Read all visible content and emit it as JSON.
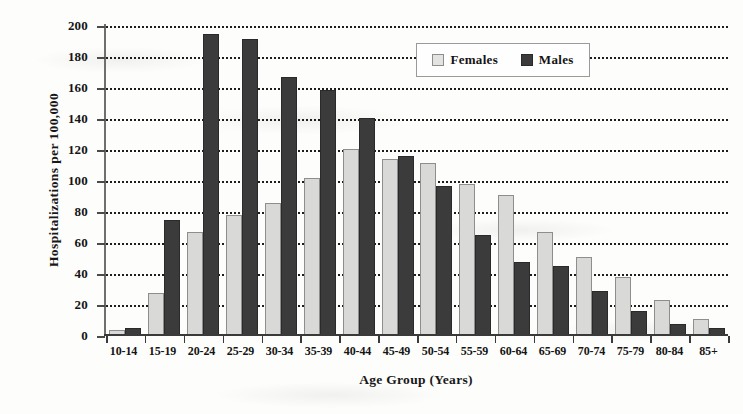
{
  "chart_data": {
    "type": "bar",
    "title": "",
    "xlabel": "Age Group (Years)",
    "ylabel": "Hospitalizations per 100,000",
    "ylim": [
      0,
      200
    ],
    "ytick_step": 20,
    "yticks": [
      "0",
      "20",
      "40",
      "60",
      "80",
      "100",
      "120",
      "140",
      "160",
      "180",
      "200"
    ],
    "grid": "horizontal-dotted",
    "legend_position": "top-center-right",
    "categories": [
      "10-14",
      "15-19",
      "20-24",
      "25-29",
      "30-34",
      "35-39",
      "40-44",
      "45-49",
      "50-54",
      "55-59",
      "60-64",
      "65-69",
      "70-74",
      "75-79",
      "80-84",
      "85+"
    ],
    "series": [
      {
        "name": "Females",
        "color": "#d9d9d7",
        "values": [
          2,
          26,
          65,
          76,
          84,
          100,
          119,
          112,
          110,
          96,
          89,
          65,
          49,
          36,
          21,
          9
        ]
      },
      {
        "name": "Males",
        "color": "#3b3b3b",
        "values": [
          3,
          73,
          193,
          190,
          165,
          157,
          139,
          114,
          95,
          63,
          46,
          43,
          27,
          14,
          6,
          3
        ]
      }
    ]
  },
  "legend": {
    "items": [
      {
        "label": "Females",
        "swatch": "light-square-swatch"
      },
      {
        "label": "Males",
        "swatch": "dark-square-swatch"
      }
    ]
  }
}
